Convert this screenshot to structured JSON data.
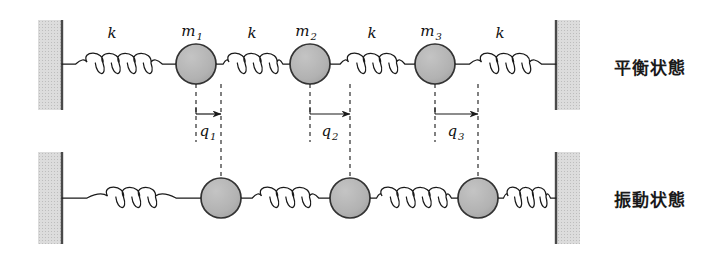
{
  "figure": {
    "rows": [
      {
        "id": "equilibrium",
        "state_label": "平衡状態",
        "masses": [
          {
            "label": "m",
            "sub": "1",
            "cx": 196,
            "cy": 64,
            "r": 20
          },
          {
            "label": "m",
            "sub": "2",
            "cx": 310,
            "cy": 64,
            "r": 20
          },
          {
            "label": "m",
            "sub": "3",
            "cx": 435,
            "cy": 64,
            "r": 20
          }
        ],
        "springs": [
          {
            "label": "k",
            "x1": 62,
            "x2": 176,
            "coils": 4,
            "label_x": 112,
            "label_y": 38
          },
          {
            "label": "k",
            "x1": 216,
            "x2": 290,
            "coils": 3,
            "label_x": 252,
            "label_y": 38
          },
          {
            "label": "k",
            "x1": 330,
            "x2": 415,
            "coils": 3,
            "label_x": 372,
            "label_y": 38
          },
          {
            "label": "k",
            "x1": 455,
            "x2": 556,
            "coils": 3,
            "label_x": 500,
            "label_y": 38
          }
        ],
        "walls": [
          {
            "side": "left",
            "x": 38,
            "y": 20,
            "w": 24,
            "h": 90
          },
          {
            "side": "right",
            "x": 556,
            "y": 20,
            "w": 24,
            "h": 90
          }
        ]
      },
      {
        "id": "vibration",
        "state_label": "振動状態",
        "masses": [
          {
            "label": "m",
            "sub": "1",
            "cx": 221,
            "cy": 198,
            "r": 20
          },
          {
            "label": "m",
            "sub": "2",
            "cx": 350,
            "cy": 198,
            "r": 20
          },
          {
            "label": "m",
            "sub": "3",
            "cx": 478,
            "cy": 198,
            "r": 20
          }
        ],
        "springs": [
          {
            "label": "k",
            "x1": 62,
            "x2": 201,
            "coils": 3,
            "label_x": 0,
            "label_y": 0
          },
          {
            "label": "k",
            "x1": 241,
            "x2": 330,
            "coils": 3,
            "label_x": 0,
            "label_y": 0
          },
          {
            "label": "k",
            "x1": 370,
            "x2": 458,
            "coils": 4,
            "label_x": 0,
            "label_y": 0
          },
          {
            "label": "k",
            "x1": 498,
            "x2": 556,
            "coils": 3,
            "label_x": 0,
            "label_y": 0
          }
        ],
        "walls": [
          {
            "side": "left",
            "x": 38,
            "y": 152,
            "w": 24,
            "h": 92
          },
          {
            "side": "right",
            "x": 556,
            "y": 152,
            "w": 24,
            "h": 92
          }
        ]
      }
    ],
    "displacements": [
      {
        "label": "q",
        "sub": "1",
        "from_x": 196,
        "to_x": 221,
        "arrow_y": 114,
        "label_x": 208,
        "label_y": 136,
        "top_y": 84,
        "bottom_y": 178
      },
      {
        "label": "q",
        "sub": "2",
        "from_x": 310,
        "to_x": 350,
        "arrow_y": 114,
        "label_x": 330,
        "label_y": 136,
        "top_y": 84,
        "bottom_y": 178
      },
      {
        "label": "q",
        "sub": "3",
        "from_x": 435,
        "to_x": 478,
        "arrow_y": 114,
        "label_x": 456,
        "label_y": 136,
        "top_y": 84,
        "bottom_y": 178
      }
    ],
    "colors": {
      "mass_fill": "#b0b0b0",
      "mass_stroke": "#333333",
      "wall_fill": "#d8d8d8",
      "wall_edge": "#4a4a4a",
      "line": "#1a1a1a",
      "background": "#ffffff"
    }
  }
}
